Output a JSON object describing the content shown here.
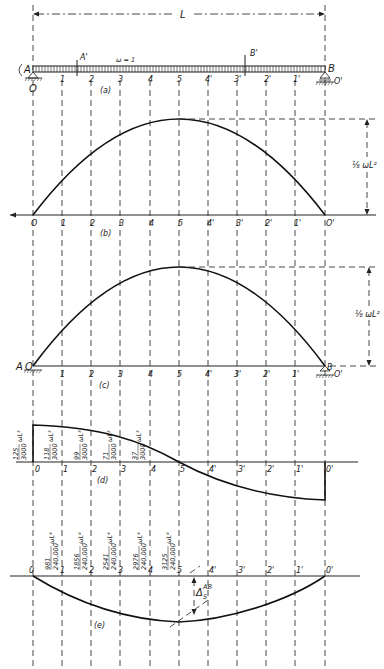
{
  "figure": {
    "span_label": "L",
    "load_label": "ω = 1",
    "stations": [
      "0",
      "1",
      "2",
      "3",
      "4",
      "5",
      "4'",
      "3'",
      "2'",
      "1'",
      "0'"
    ],
    "station_x": [
      33,
      62,
      91,
      120,
      150,
      179,
      208,
      237,
      266,
      295,
      325
    ],
    "colors": {
      "ink": "#1a1a1a",
      "background": "#ffffff"
    }
  },
  "panel_a": {
    "caption": "(a)",
    "support_left": "A",
    "support_right": "B",
    "point_A_prime": "A'",
    "point_B_prime": "B'",
    "left_station": "O",
    "right_station": "O'"
  },
  "panel_b": {
    "caption": "(b)",
    "dimension_label": "⅛ ωL²",
    "left_station": "O",
    "right_station": "O'"
  },
  "panel_c": {
    "caption": "(c)",
    "dimension_label": "⅛ ωL²",
    "left_label": "A",
    "right_label": "B",
    "left_station": "O",
    "right_station": "O'"
  },
  "panel_d": {
    "caption": "(d)",
    "labels": [
      {
        "num": "125",
        "den": "3000",
        "unit": "ωL³"
      },
      {
        "num": "118",
        "den": "3000",
        "unit": "ωL³"
      },
      {
        "num": "99",
        "den": "3000",
        "unit": "ωL³"
      },
      {
        "num": "71",
        "den": "3000",
        "unit": "ωL³"
      },
      {
        "num": "37",
        "den": "3000",
        "unit": "ωL³"
      }
    ]
  },
  "panel_e": {
    "caption": "(e)",
    "delta_label": "Δ",
    "delta_sup": "AB",
    "delta_sub": "5",
    "labels": [
      {
        "num": "981",
        "den": "240,000",
        "unit": "ωL⁴"
      },
      {
        "num": "1856",
        "den": "240,000",
        "unit": "ωL⁴"
      },
      {
        "num": "2541",
        "den": "240,000",
        "unit": "ωL⁴"
      },
      {
        "num": "2976",
        "den": "240,000",
        "unit": "ωL⁴"
      },
      {
        "num": "3125",
        "den": "240,000",
        "unit": "ωL⁴"
      }
    ]
  }
}
